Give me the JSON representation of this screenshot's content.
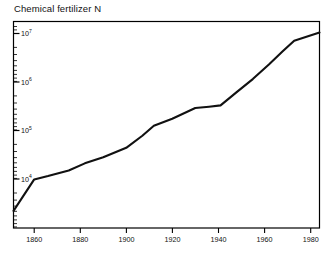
{
  "chart": {
    "title": "Chemical fertilizer N"
  },
  "chart_data": {
    "type": "line",
    "title": "Chemical fertilizer N",
    "xlabel": "",
    "ylabel": "",
    "yscale": "log",
    "xlim": [
      1851,
      1984
    ],
    "ylim": [
      1000,
      12000000
    ],
    "grid": false,
    "legend": null,
    "xticks": [
      1860,
      1880,
      1900,
      1920,
      1940,
      1960,
      1980
    ],
    "xtick_labels": [
      "1860",
      "1880",
      "1900",
      "1920",
      "1940",
      "1960",
      "1980"
    ],
    "yticks": [
      10000,
      100000,
      1000000,
      10000000
    ],
    "ytick_labels": [
      "10",
      "10",
      "10",
      "10"
    ],
    "ytick_exponents": [
      "4",
      "5",
      "6",
      "7"
    ],
    "minor_ticks": true,
    "series": [
      {
        "name": "Chemical fertilizer N",
        "x": [
          1851,
          1860,
          1866,
          1875,
          1882,
          1890,
          1900,
          1907,
          1912,
          1920,
          1930,
          1936,
          1941,
          1948,
          1955,
          1962,
          1968,
          1973,
          1984
        ],
        "values": [
          2200,
          9800,
          11500,
          15000,
          21000,
          28000,
          44000,
          78000,
          125000,
          175000,
          290000,
          310000,
          330000,
          620000,
          1150000,
          2300000,
          4300000,
          7100000,
          10500000
        ]
      }
    ]
  }
}
